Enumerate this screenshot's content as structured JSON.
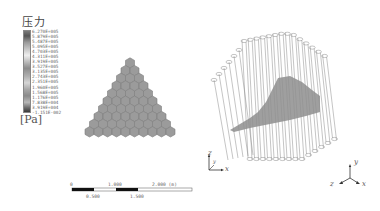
{
  "legend": {
    "title": "压力",
    "unit": "[Pa]",
    "ticks": [
      "6.270E+005",
      "5.879E+005",
      "5.487E+005",
      "5.095E+005",
      "4.703E+005",
      "4.311E+005",
      "3.919E+005",
      "3.527E+005",
      "3.135E+005",
      "2.743E+005",
      "2.351E+005",
      "1.960E+005",
      "1.568E+005",
      "1.176E+005",
      "7.838E+004",
      "3.919E+004",
      "-1.151E-002"
    ]
  },
  "scale_bar": {
    "top_labels": [
      "0",
      "1.000",
      "2.000 (m)"
    ],
    "bottom_labels": [
      "0.500",
      "1.500"
    ]
  },
  "axes_left": {
    "z": "z",
    "y": "y",
    "x": "x"
  },
  "axes_right": {
    "y": "y",
    "z": "z",
    "x": "x"
  },
  "colors": {
    "hex_fill": "#9a9a9a",
    "hex_stroke": "#7a7a7a",
    "slice_fill": "#8e8e8e",
    "wire": "#8a8a8a",
    "scale_dark": "#111111"
  }
}
